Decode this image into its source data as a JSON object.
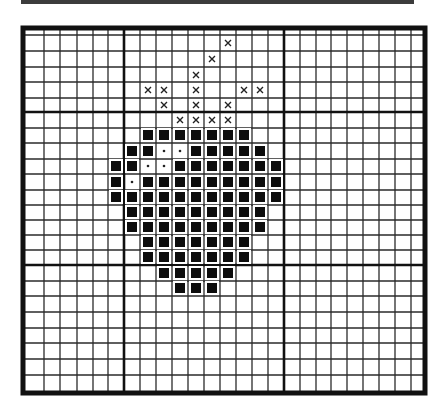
{
  "header_bar": {
    "color": "#3c3c3c"
  },
  "grid": {
    "border": {
      "x1": 23,
      "y1": 28,
      "x2": 425,
      "y2": 393,
      "width": 5,
      "color": "#111111"
    },
    "thin_line_color": "#2a2a2a",
    "thick_line_color": "#111111",
    "vertical_lines": [
      44,
      60,
      77,
      93,
      108,
      140,
      156,
      172,
      188,
      204,
      220,
      236,
      252,
      268,
      300,
      316,
      331,
      347,
      363,
      379,
      395,
      411
    ],
    "thick_vertical_lines": [
      124,
      284
    ],
    "horizontal_lines": [
      35,
      51,
      67,
      82,
      98,
      128,
      143,
      159,
      174,
      190,
      205,
      220,
      235,
      250,
      281,
      296,
      312,
      328,
      343,
      359,
      375
    ],
    "thick_horizontal_lines": [
      112,
      265
    ],
    "column_centers": [
      35,
      52,
      68,
      85,
      100,
      116,
      132,
      148,
      164,
      180,
      196,
      212,
      228,
      244,
      260,
      276,
      292,
      308,
      323,
      339,
      355,
      371,
      387,
      403,
      416
    ],
    "row_centers": [
      31,
      43,
      59,
      75,
      90,
      105,
      120,
      135,
      151,
      166,
      182,
      197,
      212,
      227,
      242,
      257,
      273,
      288,
      304,
      320,
      335,
      351,
      367,
      383
    ]
  },
  "marks": {
    "filled_square_size": 10,
    "x_marks": [
      [
        12,
        1
      ],
      [
        11,
        2
      ],
      [
        10,
        3
      ],
      [
        7,
        4
      ],
      [
        8,
        4
      ],
      [
        10,
        4
      ],
      [
        13,
        4
      ],
      [
        14,
        4
      ],
      [
        8,
        5
      ],
      [
        10,
        5
      ],
      [
        12,
        5
      ],
      [
        9,
        6
      ],
      [
        10,
        6
      ],
      [
        11,
        6
      ],
      [
        12,
        6
      ]
    ],
    "filled_rows": [
      {
        "row": 7,
        "cols": [
          7,
          8,
          9,
          10,
          11,
          12,
          13
        ]
      },
      {
        "row": 8,
        "cols": [
          6,
          7,
          10,
          11,
          12,
          13,
          14
        ]
      },
      {
        "row": 9,
        "cols": [
          5,
          6,
          9,
          10,
          11,
          12,
          13,
          14,
          15
        ]
      },
      {
        "row": 10,
        "cols": [
          5,
          7,
          8,
          9,
          10,
          11,
          12,
          13,
          14,
          15
        ]
      },
      {
        "row": 11,
        "cols": [
          5,
          6,
          7,
          8,
          9,
          10,
          11,
          12,
          13,
          14,
          15
        ]
      },
      {
        "row": 12,
        "cols": [
          6,
          7,
          8,
          9,
          10,
          11,
          12,
          13,
          14
        ]
      },
      {
        "row": 13,
        "cols": [
          6,
          7,
          8,
          9,
          10,
          11,
          12,
          13,
          14
        ]
      },
      {
        "row": 14,
        "cols": [
          7,
          8,
          9,
          10,
          11,
          12,
          13
        ]
      },
      {
        "row": 15,
        "cols": [
          7,
          8,
          9,
          10,
          11,
          12,
          13
        ]
      },
      {
        "row": 16,
        "cols": [
          8,
          9,
          10,
          11,
          12
        ]
      },
      {
        "row": 17,
        "cols": [
          9,
          10,
          11
        ]
      }
    ],
    "dot_marks": [
      [
        8,
        8
      ],
      [
        9,
        8
      ],
      [
        7,
        9
      ],
      [
        8,
        9
      ],
      [
        6,
        10
      ]
    ]
  }
}
